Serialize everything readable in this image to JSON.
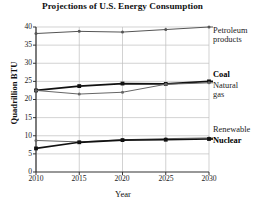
{
  "chart_data": {
    "type": "line",
    "title": "Projections of U.S. Energy Consumption",
    "xlabel": "Year",
    "ylabel": "Quadrillion BTU",
    "x": [
      2010,
      2015,
      2020,
      2025,
      2030
    ],
    "xtick_labels": [
      "2010",
      "2015",
      "2020",
      "2025",
      "2030"
    ],
    "ytick_labels": [
      "0",
      "5",
      "10",
      "15",
      "20",
      "25",
      "30",
      "35",
      "40"
    ],
    "yticks": [
      0,
      5,
      10,
      15,
      20,
      25,
      30,
      35,
      40
    ],
    "xlim": [
      2010,
      2030
    ],
    "ylim": [
      0,
      40
    ],
    "grid": true,
    "legend_position": "right-inline-labels",
    "series": [
      {
        "name": "Petroleum products",
        "label": "Petroleum\nproducts",
        "values": [
          38.2,
          38.8,
          38.6,
          39.3,
          40.0
        ],
        "color": "#555555",
        "emphasis": "normal"
      },
      {
        "name": "Coal",
        "label": "Coal",
        "values": [
          22.5,
          23.7,
          24.4,
          24.3,
          25.0
        ],
        "color": "#111111",
        "emphasis": "bold"
      },
      {
        "name": "Natural gas",
        "label": "Natural\ngas",
        "values": [
          22.5,
          21.5,
          22.0,
          24.2,
          24.6
        ],
        "color": "#666666",
        "emphasis": "normal"
      },
      {
        "name": "Renewable",
        "label": "Renewable",
        "values": [
          8.7,
          8.3,
          8.9,
          9.2,
          9.4
        ],
        "color": "#666666",
        "emphasis": "normal"
      },
      {
        "name": "Nuclear",
        "label": "Nuclear",
        "values": [
          6.5,
          8.2,
          8.8,
          8.9,
          9.1
        ],
        "color": "#111111",
        "emphasis": "bold"
      }
    ]
  },
  "chart": {
    "title": "Projections of U.S. Energy Consumption",
    "ylabel": "Quadrillion BTU",
    "xlabel": "Year",
    "yticks": {
      "t0": "0",
      "t1": "5",
      "t2": "10",
      "t3": "15",
      "t4": "20",
      "t5": "25",
      "t6": "30",
      "t7": "35",
      "t8": "40"
    },
    "xticks": {
      "t0": "2010",
      "t1": "2015",
      "t2": "2020",
      "t3": "2025",
      "t4": "2030"
    },
    "labels": {
      "petroleum": "Petroleum\nproducts",
      "coal": "Coal",
      "natural_gas": "Natural\ngas",
      "renewable": "Renewable",
      "nuclear": "Nuclear"
    },
    "colors": {
      "axis": "#333333",
      "grid": "#bfbfbf",
      "dark_series": "#111111",
      "light_series": "#666666"
    }
  }
}
